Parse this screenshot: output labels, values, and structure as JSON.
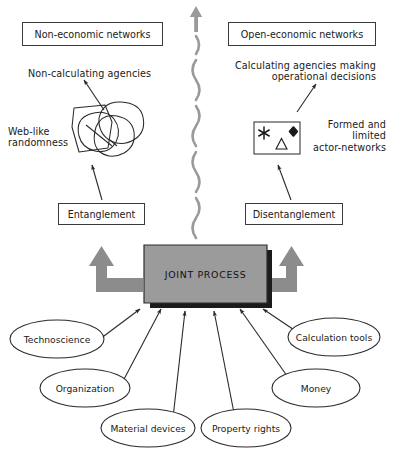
{
  "diagram": {
    "colors": {
      "stroke": "#3a3a3a",
      "text": "#1a1a1a",
      "joint_box_fill": "#9b9b9b",
      "joint_box_shadow": "#1b1b1b",
      "gray_arrow": "#8c8c8c",
      "squiggle": "#9a9a9a",
      "background": "#ffffff"
    },
    "top_boxes": [
      {
        "name": "non-economic-networks",
        "label": "Non-economic networks"
      },
      {
        "name": "open-economic-networks",
        "label": "Open-economic networks"
      }
    ],
    "annotations": [
      {
        "name": "non-calculating-agencies",
        "label": "Non-calculating agencies"
      },
      {
        "name": "calculating-agencies",
        "label": "Calculating agencies making\noperational decisions"
      },
      {
        "name": "web-like-randomness",
        "label": "Web-like\nrandomness"
      },
      {
        "name": "formed-and-limited-actor-networks",
        "label": "Formed and\nlimited\nactor-networks"
      }
    ],
    "process_boxes": [
      {
        "name": "entanglement",
        "label": "Entanglement"
      },
      {
        "name": "disentanglement",
        "label": "Disentanglement"
      }
    ],
    "center_box": {
      "label": "JOINT PROCESS"
    },
    "symbol_box": {
      "name": "actor-network-symbols",
      "symbols": [
        "snowflake-icon",
        "triangle-icon",
        "four-pointed-star-icon"
      ]
    },
    "scribble": {
      "name": "web-like-randomness-scribble"
    },
    "divider": {
      "name": "wavy-divider",
      "top_icon": "up-arrow-icon"
    },
    "side_arrows": [
      {
        "name": "left-up-arrow-icon"
      },
      {
        "name": "right-up-arrow-icon"
      }
    ],
    "input_nodes": [
      {
        "name": "technoscience",
        "label": "Technoscience"
      },
      {
        "name": "organization",
        "label": "Organization"
      },
      {
        "name": "material-devices",
        "label": "Material devices"
      },
      {
        "name": "property-rights",
        "label": "Property rights"
      },
      {
        "name": "money",
        "label": "Money"
      },
      {
        "name": "calculation-tools",
        "label": "Calculation tools"
      }
    ]
  }
}
